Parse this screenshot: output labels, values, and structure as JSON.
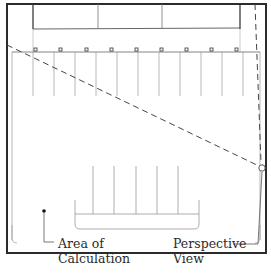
{
  "diagram": {
    "colors": {
      "outline": "#2b2b2b",
      "thin_line": "#8a8a8a",
      "dashed_line": "#4a4a4a",
      "background": "#ffffff"
    },
    "labels": {
      "area_of_calculation_line1": "Area of",
      "area_of_calculation_line2": "Calculation",
      "perspective_view_line1": "Perspective",
      "perspective_view_line2": "View"
    },
    "markers": {
      "area_point": "filled-dot",
      "viewpoint": "open-circle",
      "light_posts_count": 9
    }
  }
}
